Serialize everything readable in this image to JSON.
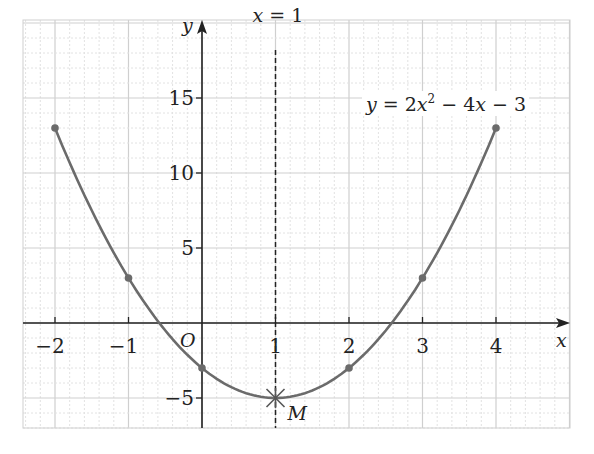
{
  "chart_data": {
    "type": "line",
    "title": "",
    "function_label": "y = 2x² − 4x − 3",
    "xlabel": "x",
    "ylabel": "y",
    "origin_label": "O",
    "xlim": [
      -2.4,
      5
    ],
    "ylim": [
      -7,
      20
    ],
    "x_ticks": [
      -2,
      -1,
      1,
      2,
      3,
      4
    ],
    "x_tick_labels": [
      "−2",
      "−1",
      "1",
      "2",
      "3",
      "4"
    ],
    "y_ticks": [
      15,
      10,
      5,
      -5
    ],
    "y_tick_labels": [
      "15",
      "10",
      "5",
      "−5"
    ],
    "grid": true,
    "points": [
      {
        "x": -2,
        "y": 13
      },
      {
        "x": -1,
        "y": 3
      },
      {
        "x": 0,
        "y": -3
      },
      {
        "x": 1,
        "y": -5
      },
      {
        "x": 2,
        "y": -3
      },
      {
        "x": 3,
        "y": 3
      },
      {
        "x": 4,
        "y": 13
      }
    ],
    "axis_of_symmetry": {
      "x": 1,
      "label": "x = 1"
    },
    "vertex": {
      "x": 1,
      "y": -5,
      "label": "M"
    },
    "colors": {
      "curve": "#6b6b6b",
      "axis": "#222222",
      "grid_major": "#cfcfcf",
      "grid_minor": "#e2e2e2"
    }
  }
}
